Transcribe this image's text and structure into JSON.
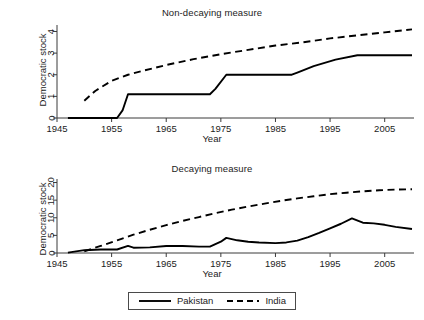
{
  "figure": {
    "background": "#ffffff",
    "line_color": "#000000",
    "axis_color": "#3a3a3a"
  },
  "legend": {
    "position": "bottom-center",
    "entries": [
      {
        "label": "Pakistan",
        "style": "solid",
        "icon": "solid-line-icon"
      },
      {
        "label": "India",
        "style": "dashed",
        "icon": "dashed-line-icon"
      }
    ]
  },
  "chart_data": [
    {
      "type": "line",
      "id": "non-decaying",
      "title": "Non-decaying measure",
      "xlabel": "Year",
      "ylabel": "Democratic stock",
      "xlim": [
        1945,
        2010
      ],
      "ylim": [
        0,
        4.3
      ],
      "xticks": [
        1945,
        1955,
        1965,
        1975,
        1985,
        1995,
        2005
      ],
      "yticks": [
        0,
        1,
        2,
        3,
        4
      ],
      "grid": false,
      "series": [
        {
          "name": "Pakistan",
          "style": "solid",
          "x": [
            1947,
            1956,
            1957,
            1958,
            1973,
            1974,
            1976,
            1988,
            1989,
            1992,
            1996,
            2000,
            2010
          ],
          "values": [
            0,
            0,
            0.35,
            1.1,
            1.1,
            1.35,
            2.0,
            2.0,
            2.1,
            2.4,
            2.7,
            2.9,
            2.9
          ]
        },
        {
          "name": "India",
          "style": "dashed",
          "x": [
            1950,
            1952,
            1955,
            1958,
            1961,
            1965,
            1970,
            1975,
            1980,
            1985,
            1990,
            1995,
            2000,
            2005,
            2010
          ],
          "values": [
            0.8,
            1.25,
            1.72,
            2.0,
            2.2,
            2.45,
            2.72,
            2.95,
            3.15,
            3.35,
            3.5,
            3.68,
            3.82,
            3.96,
            4.1
          ]
        }
      ]
    },
    {
      "type": "line",
      "id": "decaying",
      "title": "Decaying measure",
      "xlabel": "Year",
      "ylabel": "Democratic stock",
      "xlim": [
        1945,
        2010
      ],
      "ylim": [
        0,
        21
      ],
      "xticks": [
        1945,
        1955,
        1965,
        1975,
        1985,
        1995,
        2005
      ],
      "yticks": [
        0,
        5,
        10,
        15,
        20
      ],
      "grid": false,
      "series": [
        {
          "name": "Pakistan",
          "style": "solid",
          "x": [
            1947,
            1950,
            1953,
            1956,
            1958,
            1959,
            1962,
            1965,
            1968,
            1971,
            1973,
            1975,
            1976,
            1978,
            1980,
            1982,
            1985,
            1987,
            1989,
            1991,
            1993,
            1995,
            1997,
            1999,
            2001,
            2003,
            2005,
            2007,
            2010
          ],
          "values": [
            0.1,
            0.8,
            1.0,
            1.0,
            2.0,
            1.5,
            1.6,
            2.0,
            2.0,
            1.8,
            1.8,
            3.2,
            4.3,
            3.6,
            3.2,
            3.0,
            2.8,
            3.0,
            3.5,
            4.5,
            5.7,
            7.0,
            8.3,
            9.8,
            8.6,
            8.4,
            8.0,
            7.4,
            6.8
          ]
        },
        {
          "name": "India",
          "style": "dashed",
          "x": [
            1950,
            1953,
            1956,
            1959,
            1962,
            1965,
            1968,
            1971,
            1974,
            1977,
            1980,
            1983,
            1986,
            1989,
            1992,
            1995,
            1998,
            2001,
            2004,
            2007,
            2010
          ],
          "values": [
            0.5,
            2.0,
            3.6,
            5.2,
            6.6,
            7.9,
            9.1,
            10.2,
            11.3,
            12.3,
            13.2,
            14.0,
            14.8,
            15.5,
            16.1,
            16.7,
            17.1,
            17.5,
            17.8,
            18.0,
            18.1
          ]
        }
      ]
    }
  ]
}
